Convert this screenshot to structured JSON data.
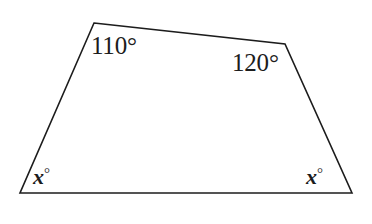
{
  "figure": {
    "type": "quadrilateral-angle-diagram",
    "stroke_color": "#1c1c1c",
    "fill_color": "#ffffff",
    "background_color": "#ffffff",
    "stroke_width": 1.6,
    "vertices": {
      "top_left": {
        "x": 94,
        "y": 23
      },
      "top_right": {
        "x": 285,
        "y": 44
      },
      "bottom_right": {
        "x": 352,
        "y": 193
      },
      "bottom_left": {
        "x": 20,
        "y": 193
      }
    },
    "polygon_points": "94,23 285,44 352,193 20,193",
    "labels": {
      "top_left": {
        "value": "110",
        "degree": "°",
        "text": "110°"
      },
      "top_right": {
        "value": "120",
        "degree": "°",
        "text": "120°"
      },
      "bottom_left": {
        "value": "x",
        "degree": "°",
        "text": "x°"
      },
      "bottom_right": {
        "value": "x",
        "degree": "°",
        "text": "x°"
      }
    }
  }
}
